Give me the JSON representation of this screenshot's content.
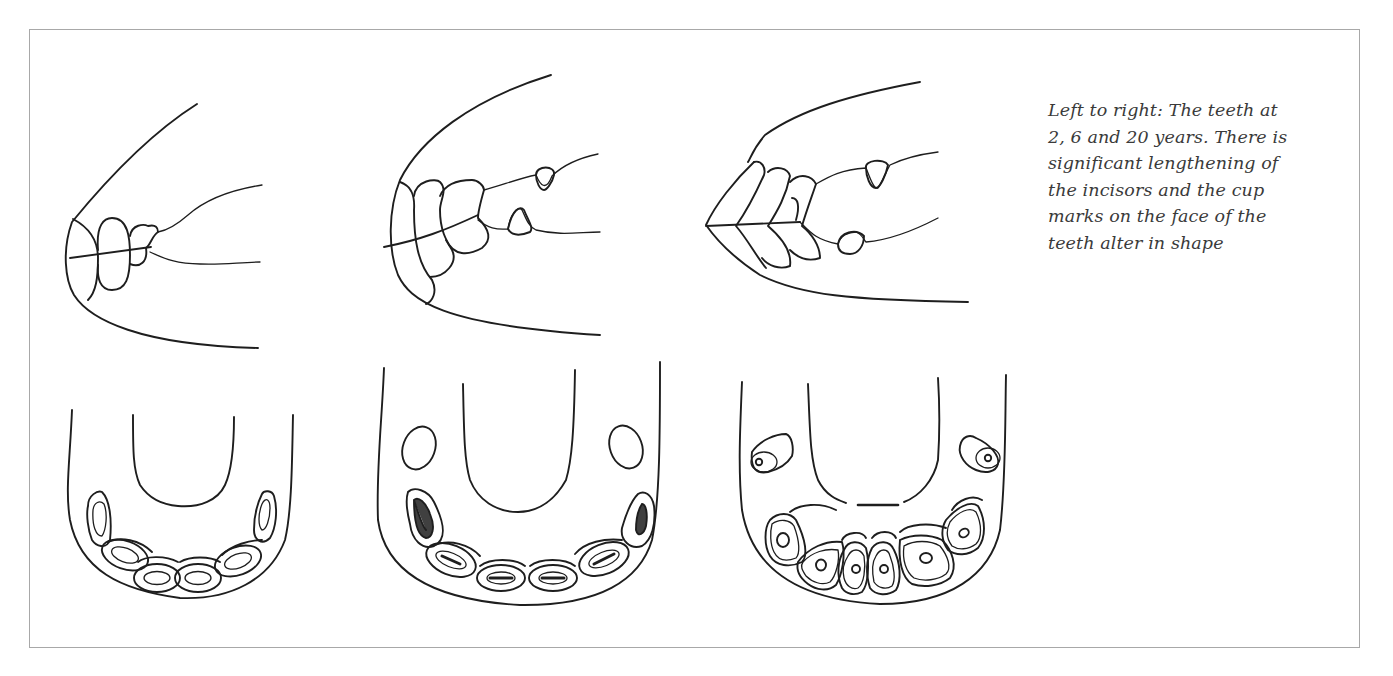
{
  "figure": {
    "caption_lines": [
      "Left to right: The teeth at",
      "2, 6 and 20 years. There is",
      "significant lengthening of",
      "the incisors and the cup",
      "marks on the face of the",
      "teeth alter in shape"
    ],
    "panels": [
      {
        "age_label": "2 years",
        "views": [
          "side-profile",
          "occlusal"
        ]
      },
      {
        "age_label": "6 years",
        "views": [
          "side-profile",
          "occlusal"
        ]
      },
      {
        "age_label": "20 years",
        "views": [
          "side-profile",
          "occlusal"
        ]
      }
    ],
    "colors": {
      "stroke": "#1e1e1e",
      "text": "#3a3a3a",
      "frame": "#a8a8a8",
      "background": "#ffffff"
    }
  }
}
